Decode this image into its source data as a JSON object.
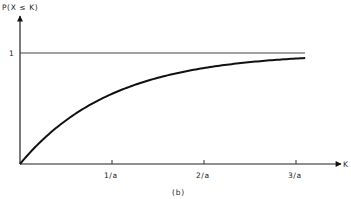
{
  "chart_data": {
    "type": "line",
    "title": "",
    "caption": "(b)",
    "xlabel": "K",
    "ylabel": "P(X ≤ K)",
    "x_ticks": [
      {
        "value": 1,
        "label": "1/a"
      },
      {
        "value": 2,
        "label": "2/a"
      },
      {
        "value": 3,
        "label": "3/a"
      }
    ],
    "y_ticks": [
      {
        "value": 1,
        "label": "1"
      }
    ],
    "xlim": [
      0,
      3.35
    ],
    "ylim": [
      0,
      1.3
    ],
    "reference_line": {
      "y": 1,
      "label": "1"
    },
    "series": [
      {
        "name": "P(X ≤ K) = 1 - e^(-aK)",
        "x": [
          0,
          0.25,
          0.5,
          0.75,
          1,
          1.25,
          1.5,
          1.75,
          2,
          2.25,
          2.5,
          2.75,
          3,
          3.1
        ],
        "values": [
          0,
          0.221,
          0.393,
          0.528,
          0.632,
          0.713,
          0.777,
          0.826,
          0.865,
          0.895,
          0.918,
          0.936,
          0.95,
          0.955
        ]
      }
    ],
    "grid": false,
    "legend": "none"
  }
}
